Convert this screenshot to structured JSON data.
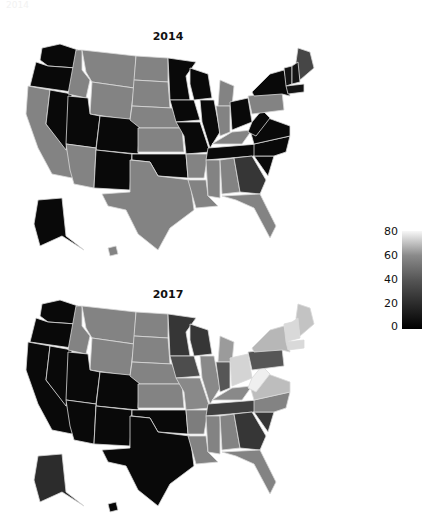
{
  "corner_label": "2014",
  "chart_data": {
    "type": "heatmap",
    "subtype": "choropleth",
    "region": "United States (states)",
    "title": "",
    "colorbar": {
      "min": 0,
      "max": 80,
      "ticks": [
        0,
        20,
        40,
        60,
        80
      ],
      "colormap": "grayscale (black = 0, white = 80)"
    },
    "panels": [
      {
        "title": "2014",
        "values": {
          "WA": 2,
          "OR": 2,
          "CA": 40,
          "NV": 2,
          "ID": 40,
          "MT": 40,
          "WY": 40,
          "UT": 2,
          "CO": 2,
          "AZ": 40,
          "NM": 2,
          "ND": 40,
          "SD": 40,
          "NE": 40,
          "KS": 40,
          "OK": 2,
          "TX": 40,
          "MN": 2,
          "IA": 2,
          "MO": 2,
          "AR": 40,
          "LA": 40,
          "WI": 2,
          "IL": 2,
          "MI": 40,
          "IN": 40,
          "OH": 2,
          "KY": 40,
          "TN": 2,
          "MS": 40,
          "AL": 40,
          "GA": 15,
          "FL": 40,
          "SC": 2,
          "NC": 2,
          "VA": 2,
          "WV": 2,
          "PA": 40,
          "NY": 2,
          "ME": 20,
          "VT": 5,
          "NH": 5,
          "MA": 5,
          "AK": 2,
          "HI": 40
        }
      },
      {
        "title": "2017",
        "values": {
          "WA": 2,
          "OR": 2,
          "CA": 2,
          "NV": 2,
          "ID": 40,
          "MT": 40,
          "WY": 40,
          "UT": 2,
          "CO": 2,
          "AZ": 2,
          "NM": 2,
          "ND": 40,
          "SD": 40,
          "NE": 40,
          "KS": 40,
          "OK": 2,
          "TX": 2,
          "MN": 15,
          "IA": 22,
          "MO": 42,
          "AR": 38,
          "LA": 40,
          "WI": 15,
          "IL": 42,
          "MI": 48,
          "IN": 25,
          "OH": 68,
          "KY": 42,
          "TN": 18,
          "MS": 40,
          "AL": 40,
          "GA": 15,
          "FL": 40,
          "SC": 15,
          "NC": 40,
          "VA": 60,
          "WV": 78,
          "PA": 25,
          "NY": 58,
          "ME": 62,
          "VT": 70,
          "NH": 70,
          "MA": 70,
          "AK": 12,
          "HI": 2
        }
      }
    ]
  },
  "panels": [
    {
      "title": "2014"
    },
    {
      "title": "2017"
    }
  ],
  "colorbar_ticks": [
    "80",
    "60",
    "40",
    "20",
    "0"
  ]
}
